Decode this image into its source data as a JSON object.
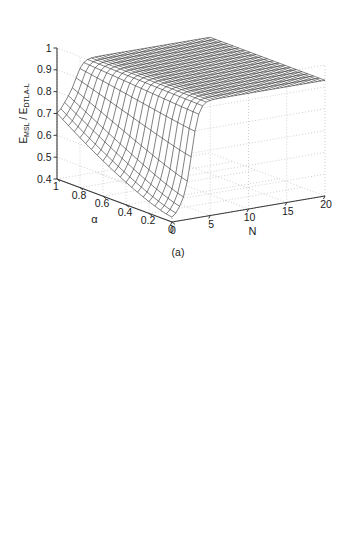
{
  "figure": {
    "background": "#ffffff",
    "axis_color": "#3a3a3a",
    "grid_color": "#b0b0b0",
    "mesh_color": "#1a1a1a",
    "surface_fill": "#ffffff"
  },
  "panels": [
    {
      "id": "a",
      "label": "(a)",
      "ylabel_main1": "E",
      "ylabel_sub1": "MSL",
      "ylabel_slash": " / ",
      "ylabel_main2": "E",
      "ylabel_sub2": "DTLA-L",
      "ylabel_full": "E_MSL / E_DTLA-L",
      "chart_data": {
        "type": "surface",
        "title": "",
        "xlabel": "N",
        "ylabel": "α",
        "zlabel": "E_MSL / E_DTLA-L",
        "xlim": [
          0,
          20
        ],
        "ylim": [
          0,
          1
        ],
        "zlim": [
          0.4,
          1
        ],
        "xticks": [
          0,
          5,
          10,
          15,
          20
        ],
        "xtick_labels": [
          "0",
          "5",
          "10",
          "15",
          "20"
        ],
        "yticks": [
          0,
          0.2,
          0.4,
          0.6,
          0.8,
          1
        ],
        "ytick_labels": [
          "0",
          "0.2",
          "0.4",
          "0.6",
          "0.8",
          "1"
        ],
        "zticks": [
          0.4,
          0.5,
          0.6,
          0.7,
          0.8,
          0.9,
          1
        ],
        "ztick_labels": [
          "0.4",
          "0.5",
          "0.6",
          "0.7",
          "0.8",
          "0.9",
          "1"
        ],
        "grid": true,
        "legend": "none",
        "view_azimuth": -37.5,
        "view_elevation": 30,
        "nx": 41,
        "ny": 21,
        "description": "E_MSL/E_DTLA-L rises steeply from ~0.42 near N=0 to a plateau of ~0.93 for N greater than about 3; at small N the ratio also decreases with decreasing alpha.",
        "surface_model": {
          "kind": "ratio_msl_over_dtla",
          "plateau": 0.93,
          "floor_min": 0.42,
          "knee_N": 2.6,
          "alpha_effect": 0.28
        }
      }
    },
    {
      "id": "b",
      "label": "(b)",
      "ylabel_main1": "E",
      "ylabel_sub1": "DTLA-L",
      "ylabel_slash": " / ",
      "ylabel_main2": "E",
      "ylabel_sub2": "MSL",
      "ylabel_full": "E_DTLA-L / E_MSL",
      "chart_data": {
        "type": "surface",
        "title": "",
        "xlabel": "N",
        "ylabel": "α",
        "zlabel": "E_DTLA-L / E_MSL",
        "xlim": [
          0,
          20
        ],
        "ylim": [
          0,
          1
        ],
        "zlim": [
          0,
          1
        ],
        "xticks": [
          0,
          5,
          10,
          15,
          20
        ],
        "xtick_labels": [
          "0",
          "5",
          "10",
          "15",
          "20"
        ],
        "yticks": [
          0,
          0.2,
          0.4,
          0.6,
          0.8,
          1
        ],
        "ytick_labels": [
          "0",
          "0.2",
          "0.4",
          "0.6",
          "0.8",
          "1"
        ],
        "zticks": [
          0,
          0.2,
          0.4,
          0.6,
          0.8,
          1
        ],
        "ztick_labels": [
          "0",
          "0.2",
          "0.4",
          "0.6",
          "0.8",
          "1"
        ],
        "grid": true,
        "legend": "none",
        "view_azimuth": -37.5,
        "view_elevation": 30,
        "nx": 21,
        "ny": 11,
        "description": "E_DTLA-L/E_MSL is flat at 1.0 for N below about 3, then drops sharply to near 0.05 and stays low out to N=20.",
        "surface_model": {
          "kind": "ratio_dtla_over_msl",
          "plateau": 1.0,
          "floor_min": 0.04,
          "knee_N": 3.0,
          "alpha_effect": 0.1
        }
      }
    }
  ]
}
